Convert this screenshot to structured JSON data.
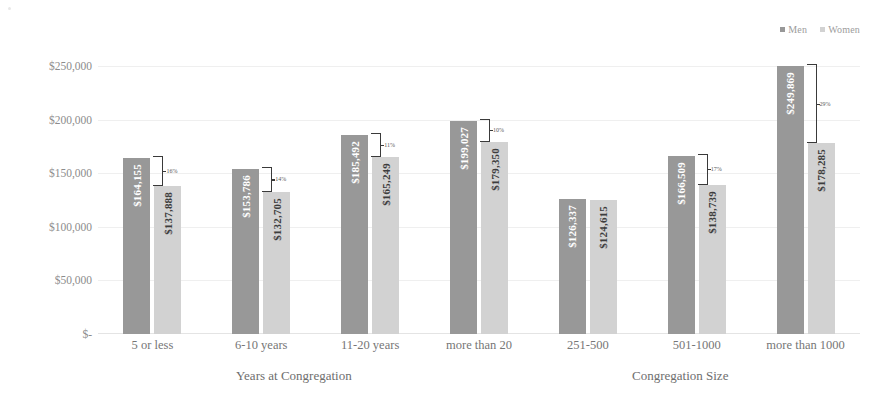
{
  "chart_data": {
    "type": "bar",
    "title": "",
    "subtitle": "",
    "xlabel": "",
    "ylabel": "",
    "ylim": [
      0,
      250000
    ],
    "yticks": [
      250000,
      200000,
      150000,
      100000,
      50000,
      0
    ],
    "ytick_labels": [
      "$250,000",
      "$200,000",
      "$150,000",
      "$100,000",
      "$50,000",
      "$-"
    ],
    "grid": true,
    "legend_position": "top-right",
    "categories": [
      "5 or less",
      "6-10 years",
      "11-20 years",
      "more than 20",
      "251-500",
      "501-1000",
      "more than 1000"
    ],
    "series": [
      {
        "name": "Men",
        "color": "#989898",
        "values": [
          164155,
          153786,
          185492,
          199027,
          126337,
          166509,
          249869
        ],
        "value_labels": [
          "$164,155",
          "$153,786",
          "$185,492",
          "$199,027",
          "$126,337",
          "$166,509",
          "$249,869"
        ]
      },
      {
        "name": "Women",
        "color": "#d2d2d2",
        "values": [
          137888,
          132705,
          165249,
          179350,
          124615,
          138739,
          178285
        ],
        "value_labels": [
          "$137,888",
          "$132,705",
          "$165,249",
          "$179,350",
          "$124,615",
          "$138,739",
          "$178,285"
        ]
      }
    ],
    "gap_annotations": [
      {
        "category": "5 or less",
        "label": "16%"
      },
      {
        "category": "6-10 years",
        "label": "14%"
      },
      {
        "category": "11-20 years",
        "label": "11%"
      },
      {
        "category": "more than 20",
        "label": "10%"
      },
      {
        "category": "251-500",
        "label": ""
      },
      {
        "category": "501-1000",
        "label": "17%"
      },
      {
        "category": "more than 1000",
        "label": "29%"
      }
    ],
    "axis_group_titles": [
      {
        "label": "Years at Congregation",
        "categories": [
          "5 or less",
          "6-10 years",
          "11-20 years",
          "more than 20"
        ]
      },
      {
        "label": "Congregation Size",
        "categories": [
          "251-500",
          "501-1000",
          "more than 1000"
        ]
      }
    ]
  },
  "legend": {
    "items": [
      {
        "label": "Men",
        "color": "#989898"
      },
      {
        "label": "Women",
        "color": "#d2d2d2"
      }
    ]
  },
  "axis_titles": {
    "left": "Years at Congregation",
    "right": "Congregation Size"
  }
}
